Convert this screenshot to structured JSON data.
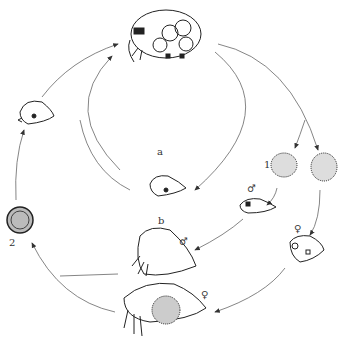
{
  "diagram": {
    "type": "life-cycle",
    "colors": {
      "ink": "#222222",
      "arrow": "#555555",
      "background": "#ffffff"
    },
    "labels": {
      "cycle_a": "a",
      "cycle_b": "b",
      "resting_eggs_label": "1",
      "fertilized_egg_label": "2",
      "male_symbol_juvenile": "♂",
      "female_symbol_juvenile": "♀",
      "male_symbol_adult": "♂",
      "female_symbol_adult": "♀"
    },
    "nodes": [
      {
        "id": "adult-parthenogenetic-female",
        "desc": "amictic female with developing embryos (top)"
      },
      {
        "id": "juvenile-from-egg",
        "desc": "young individual (left)"
      },
      {
        "id": "juvenile-center",
        "desc": "young individual (center, cycle a)"
      },
      {
        "id": "egg-1-left",
        "desc": "stippled egg (male-producing)"
      },
      {
        "id": "egg-1-right",
        "desc": "stippled egg (female-producing)"
      },
      {
        "id": "juvenile-male",
        "desc": "young male"
      },
      {
        "id": "juvenile-female",
        "desc": "young female"
      },
      {
        "id": "adult-male",
        "desc": "adult male"
      },
      {
        "id": "adult-female-with-egg",
        "desc": "mictic female carrying resting egg"
      },
      {
        "id": "resting-egg-2",
        "desc": "fertilized resting egg"
      }
    ]
  }
}
